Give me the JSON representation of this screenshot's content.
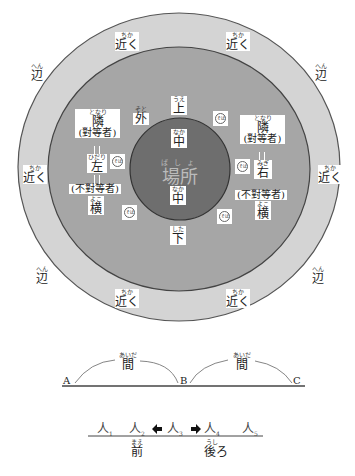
{
  "diagram": {
    "title": "場所",
    "center": {
      "ruby": "ばしょ",
      "text": "場所"
    },
    "colors": {
      "outer_ring": "#d4d4d4",
      "middle_ring": "#a6a6a6",
      "inner_circle": "#6e6e6e",
      "stroke": "#444444",
      "label_bg": "#ffffff"
    },
    "outer_ring_labels": {
      "chikaku": {
        "ruby": "ちか",
        "text": "近く"
      },
      "hen": {
        "ruby": "へん",
        "text": "辺"
      }
    },
    "inner": {
      "naka_top": {
        "ruby": "なか",
        "text": "中"
      },
      "naka_bottom": {
        "ruby": "なか",
        "text": "中"
      }
    },
    "middle": {
      "ue": {
        "ruby": "うえ",
        "text": "上"
      },
      "shita": {
        "ruby": "した",
        "text": "下"
      },
      "soto": {
        "ruby": "そと",
        "text": "外"
      },
      "soba": "そば",
      "left": {
        "tonari": {
          "ruby": "となり",
          "text": "隣",
          "note": "(對等者)"
        },
        "side": {
          "ruby": "ひだり",
          "text": "左"
        },
        "futou": "(不對等者)",
        "yoko": {
          "ruby": "よこ",
          "text": "横"
        }
      },
      "right": {
        "tonari": {
          "ruby": "となり",
          "text": "隣",
          "note": "(對等者)"
        },
        "side": {
          "ruby": "みぎ",
          "text": "右"
        },
        "futou": "(不對等者)",
        "yoko": {
          "ruby": "よこ",
          "text": "横"
        }
      }
    }
  },
  "aida_diagram": {
    "points": [
      "A",
      "B",
      "C"
    ],
    "arc_label": {
      "ruby": "あいだ",
      "text": "間"
    }
  },
  "order_diagram": {
    "people": [
      {
        "text": "人",
        "sub": "1"
      },
      {
        "text": "人",
        "sub": "2"
      },
      {
        "text": "人",
        "sub": "3"
      },
      {
        "text": "人",
        "sub": "4"
      },
      {
        "text": "人",
        "sub": "5"
      }
    ],
    "mae": {
      "ruby": "まえ",
      "text": "前"
    },
    "ushiro": {
      "ruby": "うし",
      "text": "後ろ"
    }
  }
}
